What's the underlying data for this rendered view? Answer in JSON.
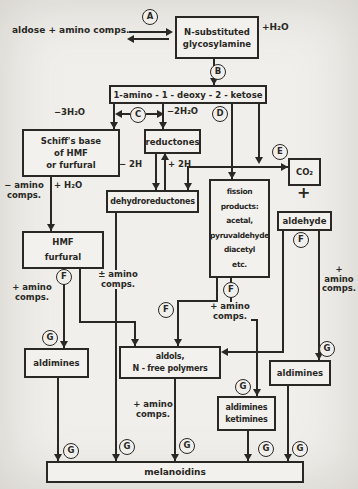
{
  "colors": {
    "ink": "#292825",
    "paper": "#f1efeb"
  },
  "steps": {
    "a": "A",
    "b": "B",
    "c": "C",
    "d": "D",
    "e": "E",
    "f": "F",
    "g": "G"
  },
  "boxes": {
    "glycosylamine": "N-substituted\nglycosylamine",
    "ketose": "1-amino - 1 - deoxy - 2 - ketose",
    "schiffs_base": "Schiff's base\nof  HMF\nor furfural",
    "reductones": "reductones",
    "dehydroreductones": "dehydroreductones",
    "fission_products": "fission\nproducts:\nacetal,\npyruvaldehyde\ndiacetyl\netc.",
    "co2": "CO₂",
    "aldehyde": "aldehyde",
    "hmf_furfural": "HMF\nfurfural",
    "aldimines_left": "aldimines",
    "aldols": "aldols,\nN - free  polymers",
    "aldimines_right": "aldimines",
    "aldimines_ketimines": "aldimines\nketimines",
    "melanoidins": "melanoidins"
  },
  "labels": {
    "reactants": "aldose + amino comps.",
    "plus_h2o_top": "+H₂O",
    "minus_3h2o": "−3H₂O",
    "minus_2h2o": "−2H₂O",
    "minus_2h": "− 2H",
    "plus_2h": "+ 2H",
    "minus_amino": "− amino\ncomps.",
    "plus_h2o_left": "+ H₂O",
    "plus_amino_left": "+ amino\ncomps.",
    "plus_minus_amino": "± amino\ncomps.",
    "plus_amino_mid": "+ amino\ncomps.",
    "plus_amino_right": "+ amino\ncomps.",
    "plus_amino_bottom": "+ amino\ncomps.",
    "plus_sign": "+"
  }
}
